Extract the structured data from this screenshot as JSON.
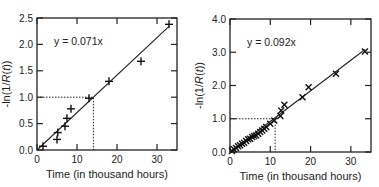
{
  "chart_data": [
    {
      "type": "scatter",
      "title": "",
      "xlabel": "Time (in thousand  hours)",
      "ylabel": "-ln(1/R(t))",
      "xlim": [
        0,
        35
      ],
      "ylim": [
        0,
        2.5
      ],
      "xticks": [
        "0",
        "10",
        "20",
        "30"
      ],
      "yticks": [
        "0.0",
        "0.5",
        "1.0",
        "1.5",
        "2.0",
        "2.5"
      ],
      "annotation": "y = 0.071x",
      "marker": "+",
      "fit_line": {
        "slope": 0.071,
        "x_range": [
          0,
          33
        ]
      },
      "reference": {
        "y": 1.0,
        "x": 14.1
      },
      "series": [
        {
          "name": "data",
          "x": [
            1.5,
            5.0,
            5.2,
            7.0,
            7.5,
            8.5,
            13.0,
            18.0,
            26.0,
            33.0
          ],
          "y": [
            0.07,
            0.2,
            0.33,
            0.45,
            0.6,
            0.78,
            0.98,
            1.3,
            1.68,
            2.38
          ]
        }
      ],
      "grid": false,
      "legend": "none"
    },
    {
      "type": "scatter",
      "title": "",
      "xlabel": "Time (in thousand  hours)",
      "ylabel": "-ln(1/R(t))",
      "xlim": [
        0,
        35
      ],
      "ylim": [
        0,
        4.0
      ],
      "xticks": [
        "0",
        "10",
        "20",
        "30"
      ],
      "yticks": [
        "0.0",
        "1.0",
        "2.0",
        "3.0",
        "4.0"
      ],
      "annotation": "y = 0.092x",
      "marker": "x",
      "fit_line": {
        "slope": 0.092,
        "x_range": [
          0,
          33.5
        ]
      },
      "reference": {
        "y": 1.0,
        "x": 11.2
      },
      "series": [
        {
          "name": "data",
          "x": [
            0.5,
            1.0,
            1.5,
            2.0,
            2.5,
            3.0,
            3.5,
            4.0,
            4.5,
            5.0,
            5.5,
            6.0,
            6.5,
            7.0,
            7.5,
            8.0,
            8.5,
            9.0,
            10.0,
            11.0,
            12.5,
            12.7,
            13.5,
            18.0,
            19.5,
            26.3,
            33.5
          ],
          "y": [
            0.03,
            0.08,
            0.12,
            0.17,
            0.2,
            0.25,
            0.28,
            0.33,
            0.38,
            0.4,
            0.45,
            0.48,
            0.5,
            0.55,
            0.6,
            0.65,
            0.7,
            0.75,
            0.85,
            0.95,
            1.08,
            1.25,
            1.42,
            1.65,
            1.95,
            2.35,
            3.02
          ]
        }
      ],
      "grid": false,
      "legend": "none"
    }
  ],
  "plots": [
    {
      "annotation": "y = 0.071x",
      "xlabel": "Time (in thousand  hours)",
      "ylabel_prefix": "-ln(1/",
      "ylabel_italic": "R",
      "ylabel_mid": "(",
      "ylabel_italic2": "t",
      "ylabel_suffix": "))"
    },
    {
      "annotation": "y = 0.092x",
      "xlabel": "Time (in thousand  hours)",
      "ylabel_prefix": "-ln(1/",
      "ylabel_italic": "R",
      "ylabel_mid": "(",
      "ylabel_italic2": "t",
      "ylabel_suffix": "))"
    }
  ]
}
